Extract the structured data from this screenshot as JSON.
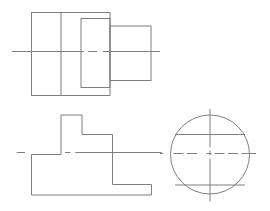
{
  "drawing": {
    "description": "Orthographic projection drawing: three views of a stepped block with a cylindrical section",
    "background_color": "#ffffff",
    "line_color": "#7f7f7f",
    "canvas": {
      "width": 270,
      "height": 211
    },
    "views": [
      {
        "name": "top-view",
        "shapes": [
          {
            "type": "rect",
            "name": "outer-block-outline",
            "x": 31.5,
            "y": 12.5,
            "w": 78.5,
            "h": 83
          },
          {
            "type": "line",
            "name": "block-divider-edge",
            "x1": 61,
            "y1": 12.5,
            "x2": 61,
            "y2": 95.5
          },
          {
            "type": "rect",
            "name": "inner-block-outline",
            "x": 81,
            "y": 18.5,
            "w": 29,
            "h": 69
          },
          {
            "type": "rect",
            "name": "right-block-outline",
            "x": 110,
            "y": 26,
            "w": 41,
            "h": 54.5
          },
          {
            "type": "line",
            "name": "horizontal-centerline-segment",
            "role": "centerline",
            "x1": 11.7,
            "y1": 51.5,
            "x2": 84,
            "y2": 51.5
          },
          {
            "type": "line",
            "name": "horizontal-centerline-segment",
            "role": "centerline",
            "x1": 88.3,
            "y1": 51.5,
            "x2": 97.3,
            "y2": 51.5
          },
          {
            "type": "line",
            "name": "horizontal-centerline-segment",
            "role": "centerline",
            "x1": 102.7,
            "y1": 51.5,
            "x2": 160,
            "y2": 51.5
          }
        ]
      },
      {
        "name": "front-view",
        "shapes": [
          {
            "type": "polygon",
            "name": "stepped-profile-outline",
            "points": [
              [
                31.5,
                154.5
              ],
              [
                61,
                154.5
              ],
              [
                61,
                115
              ],
              [
                82,
                115
              ],
              [
                82,
                134.5
              ],
              [
                112.5,
                134.5
              ],
              [
                112.5,
                184.5
              ],
              [
                151.5,
                184.5
              ],
              [
                151.5,
                195
              ],
              [
                31.5,
                195
              ]
            ]
          },
          {
            "type": "line",
            "name": "horizontal-centerline-segment",
            "role": "centerline",
            "x1": 16.7,
            "y1": 152.5,
            "x2": 25,
            "y2": 152.5
          },
          {
            "type": "line",
            "name": "horizontal-centerline-segment",
            "role": "centerline",
            "x1": 65,
            "y1": 152.5,
            "x2": 70.3,
            "y2": 152.5
          },
          {
            "type": "line",
            "name": "horizontal-centerline-segment",
            "role": "centerline",
            "x1": 75.3,
            "y1": 152.5,
            "x2": 161.7,
            "y2": 152.5
          }
        ]
      },
      {
        "name": "side-view",
        "shapes": [
          {
            "type": "circle",
            "name": "cylinder-outline",
            "cx": 210,
            "cy": 154.5,
            "r": 39.5
          },
          {
            "type": "line",
            "name": "upper-edge-line",
            "x1": 175,
            "y1": 134.5,
            "x2": 245,
            "y2": 134.5
          },
          {
            "type": "line",
            "name": "lower-edge-line",
            "x1": 175,
            "y1": 185,
            "x2": 245,
            "y2": 185
          },
          {
            "type": "line",
            "name": "vertical-centerline-segment",
            "role": "centerline",
            "x1": 210,
            "y1": 109,
            "x2": 210,
            "y2": 147.5
          },
          {
            "type": "line",
            "name": "vertical-centerline-segment",
            "role": "centerline",
            "x1": 210,
            "y1": 150.5,
            "x2": 210,
            "y2": 155.5
          },
          {
            "type": "line",
            "name": "vertical-centerline-segment",
            "role": "centerline",
            "x1": 210,
            "y1": 158.5,
            "x2": 210,
            "y2": 201.5
          },
          {
            "type": "line",
            "name": "horizontal-centerline-segment",
            "role": "centerline",
            "x1": 160,
            "y1": 153.5,
            "x2": 163,
            "y2": 153.5
          },
          {
            "type": "line",
            "name": "horizontal-centerline-segment",
            "role": "centerline",
            "x1": 173.5,
            "y1": 153.5,
            "x2": 183.5,
            "y2": 153.5
          },
          {
            "type": "line",
            "name": "horizontal-centerline-segment",
            "role": "centerline",
            "x1": 187,
            "y1": 153.5,
            "x2": 197,
            "y2": 153.5
          },
          {
            "type": "line",
            "name": "horizontal-centerline-segment",
            "role": "centerline",
            "x1": 206.5,
            "y1": 153.5,
            "x2": 211.5,
            "y2": 153.5
          },
          {
            "type": "line",
            "name": "horizontal-centerline-segment",
            "role": "centerline",
            "x1": 214.5,
            "y1": 153.5,
            "x2": 224.5,
            "y2": 153.5
          },
          {
            "type": "line",
            "name": "horizontal-centerline-segment",
            "role": "centerline",
            "x1": 228,
            "y1": 153.5,
            "x2": 238,
            "y2": 153.5
          },
          {
            "type": "line",
            "name": "horizontal-centerline-segment",
            "role": "centerline",
            "x1": 241.5,
            "y1": 153.5,
            "x2": 256,
            "y2": 153.5
          }
        ]
      }
    ]
  }
}
